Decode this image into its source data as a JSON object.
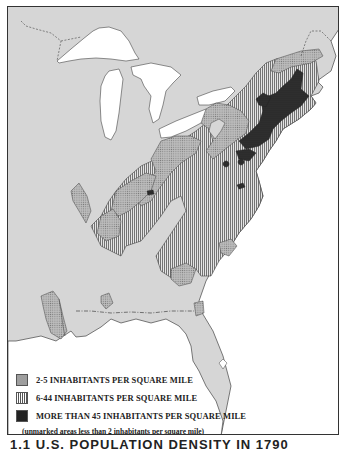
{
  "map": {
    "subject": "Eastern United States population density",
    "colors": {
      "land": "#d6d6d6",
      "water": "#ffffff",
      "low_density_fill": "#b5b5b5",
      "medium_density_lines": "#555555",
      "high_density_fill": "#2b2b2b",
      "border": "#333333"
    },
    "features": [
      "Great Lakes",
      "Atlantic coast",
      "Gulf coast",
      "Florida peninsula"
    ]
  },
  "legend": {
    "items": [
      {
        "icon": "stipple-swatch",
        "label": "2-5 INHABITANTS PER SQUARE MILE"
      },
      {
        "icon": "vertical-lines-swatch",
        "label": "6-44 INHABITANTS PER SQUARE MILE"
      },
      {
        "icon": "dark-swatch",
        "label": "MORE THAN 45 INHABITANTS PER SQUARE MILE"
      }
    ],
    "note": "(unmarked areas less than 2 inhabitants per square mile)"
  },
  "caption": {
    "text": "1.1  U.S. POPULATION DENSITY IN 1790"
  }
}
